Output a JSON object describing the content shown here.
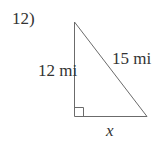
{
  "problem": {
    "number": "12)"
  },
  "triangle": {
    "leg_vertical_label": "12 mi",
    "hypotenuse_label": "15 mi",
    "leg_horizontal_label": "x",
    "right_angle_marker": true,
    "stroke_color": "#6b6b6b"
  }
}
